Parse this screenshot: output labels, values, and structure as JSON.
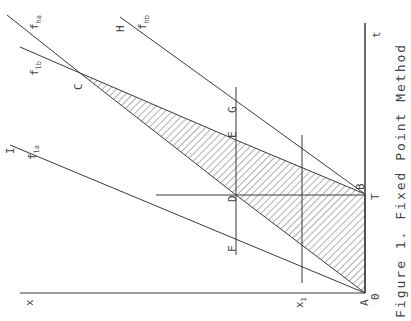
{
  "caption": "Figure 1. Fixed Point Method",
  "axes": {
    "horizontal_axis_label": "t",
    "vertical_axis_label": "x",
    "x1_label": "x",
    "x1_sub": "1",
    "T_label": "T",
    "origin_label": "0"
  },
  "points": {
    "A": "A",
    "B": "B",
    "C": "C",
    "D": "D",
    "E": "E",
    "F": "F",
    "G": "G",
    "H": "H",
    "I": "I"
  },
  "lines": {
    "f_ha": {
      "base": "f",
      "sub": "ha"
    },
    "f_hb": {
      "base": "f",
      "sub": "hb"
    },
    "f_la": {
      "base": "f",
      "sub": "la"
    },
    "f_lb": {
      "base": "f",
      "sub": "lb"
    }
  },
  "colors": {
    "line": "#3a3a3a",
    "text": "#444444",
    "background": "#ffffff"
  }
}
